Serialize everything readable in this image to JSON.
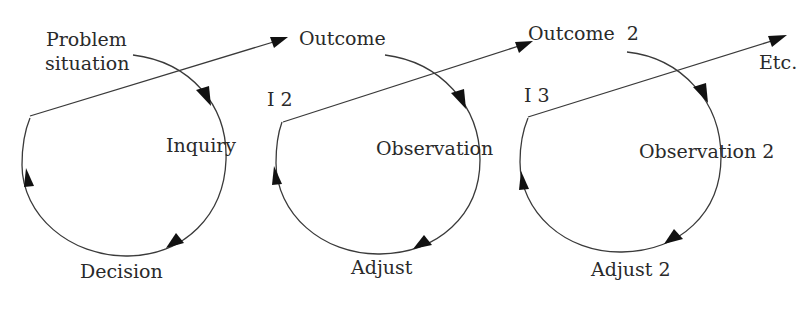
{
  "diagram": {
    "type": "iterative inquiry cycles",
    "cycles": [
      {
        "start_label_line1": "Problem",
        "start_label_line2": "situation",
        "right_label": "Inquiry",
        "bottom_label": "Decision",
        "outcome_label": "Outcome"
      },
      {
        "iteration_label": "I 2",
        "right_label": "Observation",
        "bottom_label": "Adjust",
        "outcome_label": "Outcome  2"
      },
      {
        "iteration_label": "I 3",
        "right_label": "Observation 2",
        "bottom_label": "Adjust 2",
        "outcome_label": "Etc."
      }
    ],
    "colors": {
      "stroke": "#3a3a3a",
      "arrowhead": "#111111",
      "text": "#2a2a2a",
      "background": "#ffffff"
    }
  }
}
